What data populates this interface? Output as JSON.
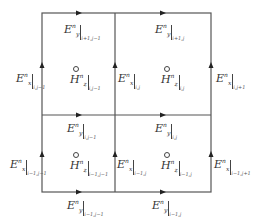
{
  "diagram": {
    "type": "yee-grid-2x2",
    "grid": {
      "x": [
        42,
        115,
        211
      ],
      "y": [
        13,
        115,
        192
      ]
    },
    "edges": [
      {
        "field": "E",
        "comp": "y",
        "time": "n",
        "index": "i+1,j-1",
        "pos": "top-left"
      },
      {
        "field": "E",
        "comp": "y",
        "time": "n",
        "index": "i+1,j",
        "pos": "top-right"
      },
      {
        "field": "E",
        "comp": "x",
        "time": "n",
        "index": "i,j-1",
        "pos": "left-upper"
      },
      {
        "field": "E",
        "comp": "x",
        "time": "n",
        "index": "i,j",
        "pos": "mid-upper"
      },
      {
        "field": "E",
        "comp": "x",
        "time": "n",
        "index": "i,j+1",
        "pos": "right-upper"
      },
      {
        "field": "E",
        "comp": "y",
        "time": "n",
        "index": "i,j-1",
        "pos": "middle-left"
      },
      {
        "field": "E",
        "comp": "y",
        "time": "n",
        "index": "i,j",
        "pos": "middle-right"
      },
      {
        "field": "E",
        "comp": "x",
        "time": "n",
        "index": "i-1,j-1",
        "pos": "left-lower"
      },
      {
        "field": "E",
        "comp": "x",
        "time": "n",
        "index": "i-1,j",
        "pos": "mid-lower"
      },
      {
        "field": "E",
        "comp": "x",
        "time": "n",
        "index": "i-1,j+1",
        "pos": "right-lower"
      },
      {
        "field": "E",
        "comp": "y",
        "time": "n",
        "index": "i-1,j-1",
        "pos": "bottom-left"
      },
      {
        "field": "E",
        "comp": "y",
        "time": "n",
        "index": "i-1,j",
        "pos": "bottom-right"
      }
    ],
    "cells": [
      {
        "field": "H",
        "comp": "z",
        "time": "n",
        "index": "i,j-1",
        "pos": "upper-left"
      },
      {
        "field": "H",
        "comp": "z",
        "time": "n",
        "index": "i,j",
        "pos": "upper-right"
      },
      {
        "field": "H",
        "comp": "z",
        "time": "n",
        "index": "i-1,j-1",
        "pos": "lower-left"
      },
      {
        "field": "H",
        "comp": "z",
        "time": "n",
        "index": "i-1,j",
        "pos": "lower-right"
      }
    ]
  },
  "labels": {
    "E": "E",
    "H": "H",
    "x": "x",
    "y": "y",
    "z": "z",
    "n": "n",
    "i1_jm1": "i+1,j−1",
    "i1_j": "i+1,j",
    "i_jm1": "i,j−1",
    "i_j": "i,j",
    "i_j1": "i,j+1",
    "im1_jm1": "i−1,j−1",
    "im1_j": "i−1,j",
    "im1_j1": "i−1,j+1"
  }
}
